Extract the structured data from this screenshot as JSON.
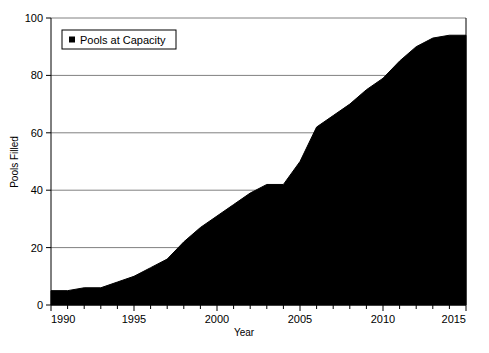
{
  "chart_data": {
    "type": "area",
    "title": "",
    "xlabel": "Year",
    "ylabel": "Pools Filled",
    "xlim": [
      1990,
      2015
    ],
    "ylim": [
      0,
      100
    ],
    "grid": true,
    "legend_position": "top-left",
    "series": [
      {
        "name": "Pools at Capacity",
        "color": "#000000",
        "x": [
          1990,
          1991,
          1992,
          1993,
          1994,
          1995,
          1996,
          1997,
          1998,
          1999,
          2000,
          2001,
          2002,
          2003,
          2004,
          2005,
          2006,
          2007,
          2008,
          2009,
          2010,
          2011,
          2012,
          2013,
          2014,
          2015
        ],
        "values": [
          5,
          5,
          6,
          6,
          8,
          10,
          13,
          16,
          22,
          27,
          31,
          35,
          39,
          42,
          42,
          50,
          62,
          66,
          70,
          75,
          79,
          85,
          90,
          93,
          94,
          94
        ]
      }
    ],
    "x_ticks_major": [
      1990,
      1995,
      2000,
      2005,
      2010,
      2015
    ],
    "x_ticks_minor_step": 1,
    "y_ticks": [
      0,
      20,
      40,
      60,
      80,
      100
    ],
    "x_tick_labels": [
      "1990",
      "1995",
      "2000",
      "2005",
      "2010",
      "2015"
    ],
    "y_tick_labels": [
      "0",
      "20",
      "40",
      "60",
      "80",
      "100"
    ]
  },
  "legend": {
    "entries": [
      {
        "label": "Pools at Capacity",
        "marker": "square-marker",
        "color": "#000000"
      }
    ]
  },
  "axes": {
    "x_axis_title": "Year",
    "y_axis_title": "Pools Filled"
  }
}
